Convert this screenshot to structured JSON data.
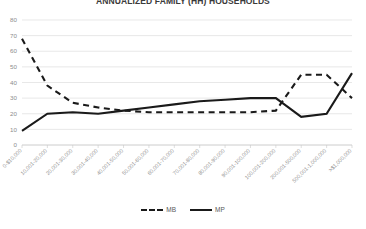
{
  "chart_data": {
    "type": "line",
    "title": "ANNUALIZED FAMILY (HH) HOUSEHOLDS",
    "xlabel": "",
    "ylabel": "",
    "ylim": [
      0,
      80
    ],
    "ytick_step": 10,
    "yticks": [
      "80",
      "70",
      "60",
      "50",
      "40",
      "30",
      "20",
      "10",
      "0"
    ],
    "grid": true,
    "legend_position": "bottom",
    "categories": [
      "0-$10,000",
      "10,001-20,000",
      "20,001-30,000",
      "30,001-40,000",
      "40,001-50,000",
      "50,001-60,000",
      "60,001-70,000",
      "70,001-80,000",
      "80,001-90,000",
      "90,001-100,000",
      "100,001-200,000",
      "200,001-500,000",
      "500,001-1,000,000",
      ">$1,000,000"
    ],
    "series": [
      {
        "name": "MB",
        "style": "dashed",
        "color": "#1a1a1a",
        "values": [
          68,
          38,
          27,
          24,
          22,
          21,
          21,
          21,
          21,
          21,
          22,
          45,
          45,
          30
        ]
      },
      {
        "name": "MP",
        "style": "solid",
        "color": "#1a1a1a",
        "values": [
          9,
          20,
          21,
          20,
          22,
          24,
          26,
          28,
          29,
          30,
          30,
          18,
          20,
          46
        ]
      }
    ]
  },
  "legend": {
    "items": [
      {
        "label": "MB",
        "style": "dashed"
      },
      {
        "label": "MP",
        "style": "solid"
      }
    ]
  }
}
